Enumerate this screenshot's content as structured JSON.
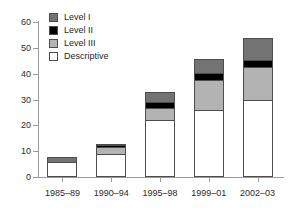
{
  "chart_data": {
    "type": "bar",
    "subtype": "stacked-vertical",
    "title": "",
    "subtitle": "",
    "xlabel": "",
    "ylabel": "",
    "categories": [
      "1985–89",
      "1990–94",
      "1995–98",
      "1999–01",
      "2002–03"
    ],
    "series": [
      {
        "name": "Descriptive",
        "color": "#ffffff",
        "values": [
          6,
          9,
          22,
          26,
          30
        ]
      },
      {
        "name": "Level III",
        "color": "#b3b3b3",
        "values": [
          0,
          3,
          5,
          12,
          13
        ]
      },
      {
        "name": "Level II",
        "color": "#000000",
        "values": [
          0,
          1,
          3,
          3,
          3
        ]
      },
      {
        "name": "Level I",
        "color": "#737373",
        "values": [
          2,
          1,
          4,
          6,
          9
        ]
      }
    ],
    "totals": [
      8,
      14,
      34,
      47,
      55
    ],
    "stack_order_bottom_to_top": [
      "Descriptive",
      "Level III",
      "Level II",
      "Level I"
    ],
    "yticks": [
      0,
      10,
      20,
      30,
      40,
      50,
      60
    ],
    "ylim": [
      0,
      60
    ],
    "grid": false,
    "legend_position": "top-left",
    "legend_entries": [
      {
        "label": "Level I",
        "color": "#737373"
      },
      {
        "label": "Level II",
        "color": "#000000"
      },
      {
        "label": "Level III",
        "color": "#b3b3b3"
      },
      {
        "label": "Descriptive",
        "color": "#ffffff"
      }
    ]
  },
  "axis": {
    "line_color": "#9a9a9a",
    "tick_color": "#9a9a9a",
    "text_color": "#2b2b2b"
  },
  "bar_style": {
    "outline_color": "#4d4d4d"
  }
}
